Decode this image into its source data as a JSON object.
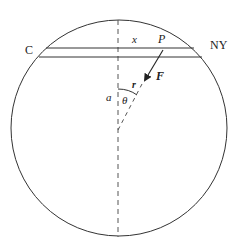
{
  "diagram": {
    "type": "gravity tunnel through earth",
    "labels": {
      "left_city": "C",
      "right_city": "NY",
      "distance": "x",
      "point": "P",
      "force": "F",
      "radius_vector": "r",
      "center_distance": "a",
      "angle": "θ"
    },
    "colors": {
      "stroke": "#333333",
      "dashed": "#555555",
      "text": "#222222"
    }
  }
}
